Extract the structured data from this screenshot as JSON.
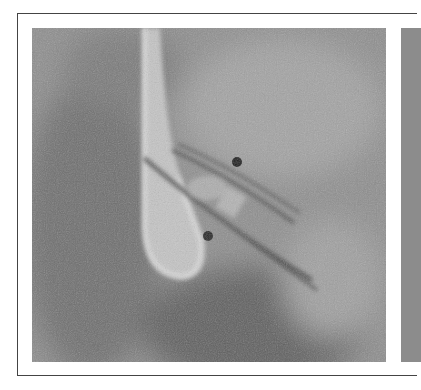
{
  "figure": {
    "type": "fluoroscopy-panel",
    "panels": [
      {
        "id": "left",
        "description": "grayscale angiographic image with bright contrast-filled structure and two catheter tubes with dark radiopaque markers"
      },
      {
        "id": "right",
        "description": "partially visible adjacent panel"
      }
    ],
    "colors": {
      "background": "#ffffff",
      "border": "#444444",
      "image_mid": "#8a8a8a"
    }
  }
}
